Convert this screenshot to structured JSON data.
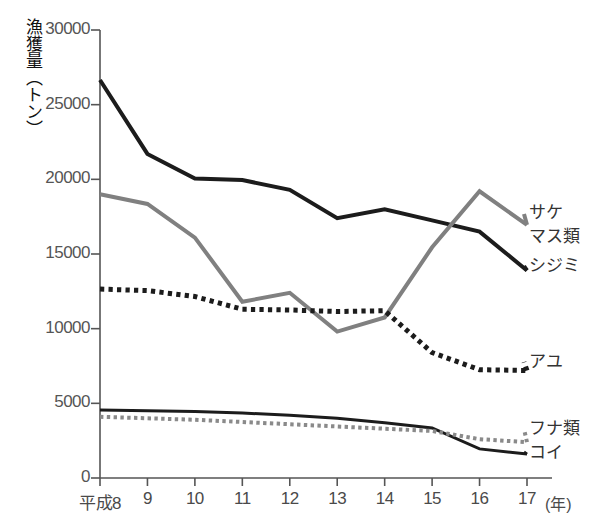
{
  "chart_data": {
    "type": "line",
    "title": "",
    "xlabel": "(年)",
    "ylabel": "漁獲量（トン）",
    "x_axis_prefix": "平成",
    "categories": [
      "8",
      "9",
      "10",
      "11",
      "12",
      "13",
      "14",
      "15",
      "16",
      "17"
    ],
    "xtick_labels": [
      "平成8",
      "9",
      "10",
      "11",
      "12",
      "13",
      "14",
      "15",
      "16",
      "17"
    ],
    "x_unit_label": "(年)",
    "ytick_labels": [
      "0",
      "5000",
      "10000",
      "15000",
      "20000",
      "25000",
      "30000"
    ],
    "ytick_values": [
      0,
      5000,
      10000,
      15000,
      20000,
      25000,
      30000
    ],
    "ylim": [
      0,
      30000
    ],
    "grid": false,
    "legend_position": "right-inline",
    "series": [
      {
        "name": "シジミ",
        "label": "シジミ",
        "color": "#1c1c1c",
        "style": "solid",
        "width": 4,
        "values": [
          26650,
          21700,
          20050,
          19950,
          19300,
          17400,
          18000,
          17250,
          16500,
          13900
        ]
      },
      {
        "name": "サケマス類",
        "label": "サケ\nマス類",
        "label_line1": "サケ",
        "label_line2": "マス類",
        "color": "#808080",
        "style": "solid",
        "width": 4,
        "values": [
          19000,
          18350,
          16100,
          11800,
          12400,
          9800,
          10750,
          15450,
          19200,
          16950
        ]
      },
      {
        "name": "アユ",
        "label": "アユ",
        "color": "#1c1c1c",
        "style": "dotted",
        "width": 5,
        "values": [
          12650,
          12550,
          12150,
          11300,
          11250,
          11150,
          11200,
          8400,
          7250,
          7200
        ]
      },
      {
        "name": "コイ",
        "label": "コイ",
        "color": "#1c1c1c",
        "style": "solid",
        "width": 3,
        "values": [
          4550,
          4500,
          4450,
          4350,
          4200,
          4000,
          3700,
          3350,
          1950,
          1600
        ]
      },
      {
        "name": "フナ類",
        "label": "フナ類",
        "color": "#8a8a8a",
        "style": "dotted",
        "width": 4,
        "values": [
          4100,
          4000,
          3900,
          3750,
          3600,
          3450,
          3300,
          3150,
          2600,
          2400
        ]
      }
    ]
  },
  "labels": {
    "sake_masu_line1": "サケ",
    "sake_masu_line2": "マス類",
    "shijimi": "シジミ",
    "ayu": "アユ",
    "funa": "フナ類",
    "koi": "コイ"
  }
}
